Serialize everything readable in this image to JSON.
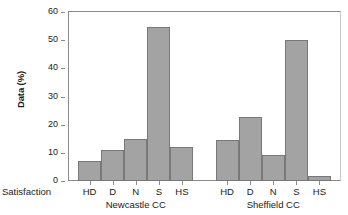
{
  "chart_data": {
    "type": "bar",
    "title": "",
    "xlabel": "Satisfaction",
    "ylabel": "Data (%)",
    "ylim": [
      0,
      60
    ],
    "yticks": [
      0,
      10,
      20,
      30,
      40,
      50,
      60
    ],
    "ytick_labels": [
      "0",
      "10",
      "20",
      "30",
      "40",
      "50",
      "60"
    ],
    "grid": false,
    "legend": "none",
    "categories": [
      "HD",
      "D",
      "N",
      "S",
      "HS"
    ],
    "groups": [
      {
        "name": "Newcastle CC",
        "categories": [
          "HD",
          "D",
          "N",
          "S",
          "HS"
        ],
        "values": [
          7.2,
          10.9,
          14.8,
          54.8,
          12.0
        ]
      },
      {
        "name": "Sheffield CC",
        "categories": [
          "HD",
          "D",
          "N",
          "S",
          "HS"
        ],
        "values": [
          14.7,
          22.7,
          9.4,
          50.0,
          1.7
        ]
      }
    ],
    "bar_color": "#a3a3a3",
    "bar_edge_color": "#787878",
    "axis_color": "#8a8a8a"
  }
}
